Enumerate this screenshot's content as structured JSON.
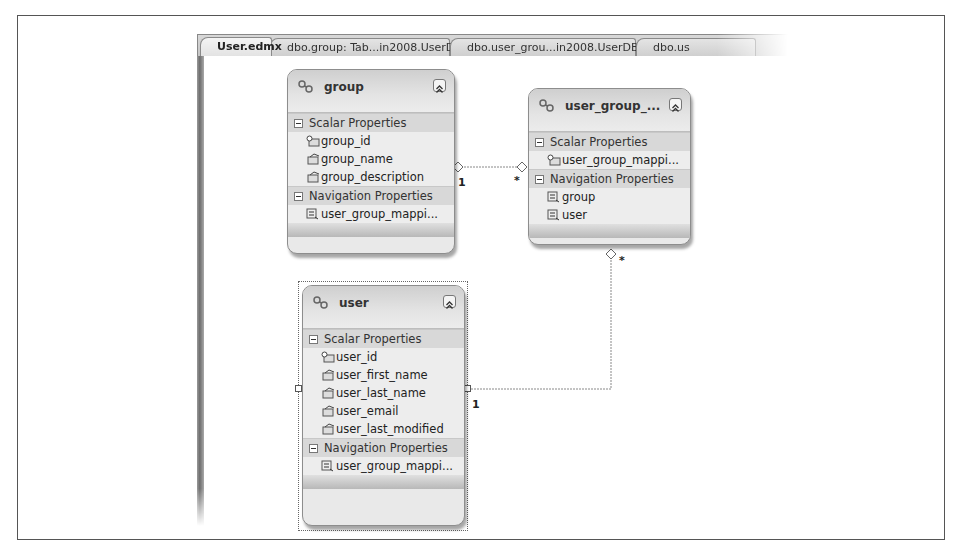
{
  "tabs": [
    {
      "label": "User.edmx",
      "active": true
    },
    {
      "label": "dbo.group: Tab...in2008.UserDB)",
      "active": false
    },
    {
      "label": "dbo.user_grou...in2008.UserDB)",
      "active": false
    },
    {
      "label": "dbo.us",
      "active": false
    }
  ],
  "entities": {
    "group": {
      "title": "group",
      "scalar_header": "Scalar Properties",
      "scalar": [
        {
          "name": "group_id",
          "key": true
        },
        {
          "name": "group_name",
          "key": false
        },
        {
          "name": "group_description",
          "key": false
        }
      ],
      "nav_header": "Navigation Properties",
      "navigation": [
        "user_group_mappi..."
      ]
    },
    "user_group": {
      "title": "user_group_...",
      "scalar_header": "Scalar Properties",
      "scalar": [
        {
          "name": "user_group_mappi...",
          "key": true
        }
      ],
      "nav_header": "Navigation Properties",
      "navigation": [
        "group",
        "user"
      ]
    },
    "user": {
      "title": "user",
      "scalar_header": "Scalar Properties",
      "scalar": [
        {
          "name": "user_id",
          "key": true
        },
        {
          "name": "user_first_name",
          "key": false
        },
        {
          "name": "user_last_name",
          "key": false
        },
        {
          "name": "user_email",
          "key": false
        },
        {
          "name": "user_last_modified",
          "key": false
        }
      ],
      "nav_header": "Navigation Properties",
      "navigation": [
        "user_group_mappi..."
      ]
    }
  },
  "associations": [
    {
      "from": "group",
      "to": "user_group",
      "from_multiplicity": "1",
      "to_multiplicity": "*"
    },
    {
      "from": "user",
      "to": "user_group",
      "from_multiplicity": "1",
      "to_multiplicity": "*"
    }
  ],
  "colors": {
    "entity_bg": "#e9e9e9",
    "section_bg": "#d8d8d8",
    "border": "#8d8d8d"
  }
}
